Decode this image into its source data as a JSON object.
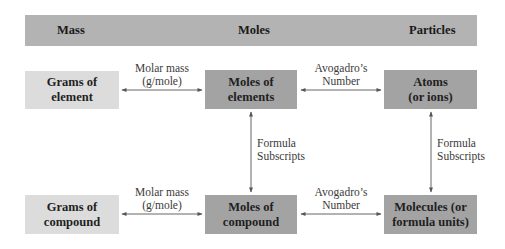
{
  "header": {
    "columns": [
      "Mass",
      "Moles",
      "Particles"
    ]
  },
  "boxes": {
    "grams_of_element": {
      "line1": "Grams of",
      "line2": "element"
    },
    "moles_of_elements": {
      "line1": "Moles of",
      "line2": "elements"
    },
    "atoms": {
      "line1": "Atoms",
      "line2": "(or ions)"
    },
    "grams_of_compound": {
      "line1": "Grams of",
      "line2": "compound"
    },
    "moles_of_compound": {
      "line1": "Moles of",
      "line2": "compound"
    },
    "molecules": {
      "line1": "Molecules (or",
      "line2": "formula units)"
    }
  },
  "arrows": {
    "molar_mass_top": {
      "line1": "Molar mass",
      "line2": "(g/mole)"
    },
    "avogadro_top": {
      "line1": "Avogadro’s",
      "line2": "Number"
    },
    "formula_left": {
      "line1": "Formula",
      "line2": "Subscripts"
    },
    "formula_right": {
      "line1": "Formula",
      "line2": "Subscripts"
    },
    "molar_mass_bottom": {
      "line1": "Molar mass",
      "line2": "(g/mole)"
    },
    "avogadro_bottom": {
      "line1": "Avogadro’s",
      "line2": "Number"
    }
  },
  "colors": {
    "header_bg": "#b3b3b3",
    "mass_box_bg": "#dcdcdc",
    "mole_particle_box_bg": "#a3a3a3",
    "arrow": "#555555"
  }
}
